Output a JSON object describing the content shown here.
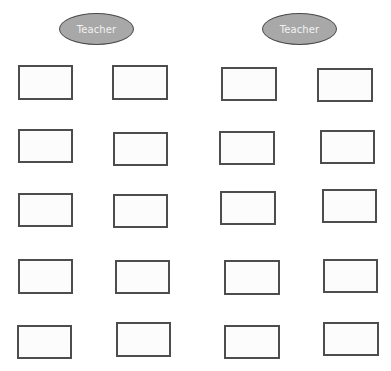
{
  "diagram": {
    "background": "#ffffff",
    "teacher_fill": "#a8a8a8",
    "teacher_border": "#4a4a4a",
    "desk_border": "#4d4d4d",
    "teachers": [
      {
        "label": "Teacher",
        "x": 59,
        "y": 13,
        "w": 75,
        "h": 32
      },
      {
        "label": "Teacher",
        "x": 262,
        "y": 13,
        "w": 75,
        "h": 32
      }
    ],
    "desks": [
      {
        "row": 1,
        "col": 1,
        "x": 18,
        "y": 65,
        "w": 55,
        "h": 35
      },
      {
        "row": 1,
        "col": 2,
        "x": 112,
        "y": 65,
        "w": 56,
        "h": 35
      },
      {
        "row": 1,
        "col": 3,
        "x": 221,
        "y": 67,
        "w": 56,
        "h": 34
      },
      {
        "row": 1,
        "col": 4,
        "x": 317,
        "y": 68,
        "w": 56,
        "h": 34
      },
      {
        "row": 2,
        "col": 1,
        "x": 18,
        "y": 129,
        "w": 55,
        "h": 34
      },
      {
        "row": 2,
        "col": 2,
        "x": 113,
        "y": 132,
        "w": 55,
        "h": 34
      },
      {
        "row": 2,
        "col": 3,
        "x": 219,
        "y": 131,
        "w": 56,
        "h": 34
      },
      {
        "row": 2,
        "col": 4,
        "x": 320,
        "y": 130,
        "w": 55,
        "h": 34
      },
      {
        "row": 3,
        "col": 1,
        "x": 18,
        "y": 193,
        "w": 55,
        "h": 34
      },
      {
        "row": 3,
        "col": 2,
        "x": 113,
        "y": 194,
        "w": 55,
        "h": 34
      },
      {
        "row": 3,
        "col": 3,
        "x": 220,
        "y": 191,
        "w": 56,
        "h": 34
      },
      {
        "row": 3,
        "col": 4,
        "x": 322,
        "y": 189,
        "w": 55,
        "h": 34
      },
      {
        "row": 4,
        "col": 1,
        "x": 18,
        "y": 259,
        "w": 55,
        "h": 35
      },
      {
        "row": 4,
        "col": 2,
        "x": 115,
        "y": 260,
        "w": 55,
        "h": 34
      },
      {
        "row": 4,
        "col": 3,
        "x": 224,
        "y": 260,
        "w": 56,
        "h": 35
      },
      {
        "row": 4,
        "col": 4,
        "x": 323,
        "y": 259,
        "w": 55,
        "h": 34
      },
      {
        "row": 5,
        "col": 1,
        "x": 17,
        "y": 325,
        "w": 55,
        "h": 34
      },
      {
        "row": 5,
        "col": 2,
        "x": 116,
        "y": 322,
        "w": 55,
        "h": 35
      },
      {
        "row": 5,
        "col": 3,
        "x": 224,
        "y": 325,
        "w": 56,
        "h": 34
      },
      {
        "row": 5,
        "col": 4,
        "x": 323,
        "y": 322,
        "w": 56,
        "h": 34
      }
    ]
  }
}
